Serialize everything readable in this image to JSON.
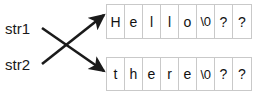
{
  "diagram": {
    "colors": {
      "arrow": "#1a1a1a",
      "cell_border": "#c9c9c9",
      "text": "#111111",
      "background": "#ffffff"
    },
    "pointers": [
      {
        "id": "str1",
        "label": "str1",
        "points_to": "array-bottom"
      },
      {
        "id": "str2",
        "label": "str2",
        "points_to": "array-top"
      }
    ],
    "arrays": [
      {
        "id": "array-top",
        "name": "hello-buffer",
        "cells": [
          "H",
          "e",
          "l",
          "l",
          "o",
          "\\0",
          "?",
          "?"
        ]
      },
      {
        "id": "array-bottom",
        "name": "there-buffer",
        "cells": [
          "t",
          "h",
          "e",
          "r",
          "e",
          "\\0",
          "?",
          "?"
        ]
      }
    ]
  }
}
